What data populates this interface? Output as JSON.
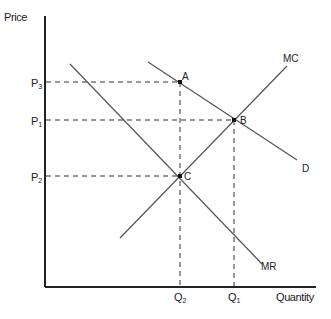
{
  "diagram": {
    "title": "",
    "axes": {
      "y_label": "Price",
      "x_label": "Quantity"
    },
    "price_ticks": [
      {
        "label": "P",
        "sub": "3",
        "y": 82
      },
      {
        "label": "P",
        "sub": "1",
        "y": 120
      },
      {
        "label": "P",
        "sub": "2",
        "y": 176
      }
    ],
    "quantity_ticks": [
      {
        "label": "Q",
        "sub": "2",
        "x": 180
      },
      {
        "label": "Q",
        "sub": "1",
        "x": 234
      }
    ],
    "curves": {
      "mc": "MC",
      "d": "D",
      "mr": "MR"
    },
    "points": {
      "a": "A",
      "b": "B",
      "c": "C"
    },
    "colors": {
      "axis": "#222222",
      "curve": "#555555",
      "dashed": "#333333",
      "text": "#222222"
    }
  }
}
